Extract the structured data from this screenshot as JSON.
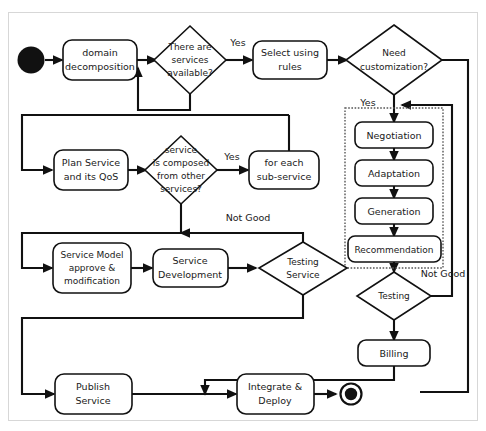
{
  "diagram": {
    "colors": {
      "stroke": "#111111",
      "background": "#ffffff",
      "group_frame": "#555555",
      "text": "#1a1a1a"
    },
    "start_node": {
      "name": "start",
      "label": ""
    },
    "end_node": {
      "name": "end",
      "label": ""
    },
    "nodes": [
      {
        "id": "domain_decomposition",
        "label": "domain\ndecomposition",
        "line1": "domain",
        "line2": "decomposition",
        "shape": "rounded-box"
      },
      {
        "id": "select_using_rules",
        "label": "Select using\nrules",
        "line1": "Select using",
        "line2": "rules",
        "shape": "rounded-box"
      },
      {
        "id": "plan_service_qos",
        "label": "Plan Service\nand its QoS",
        "line1": "Plan Service",
        "line2": "and its QoS",
        "shape": "rounded-box"
      },
      {
        "id": "for_each_sub_service",
        "label": "for each\nsub-service",
        "line1": "for each",
        "line2": "sub-service",
        "shape": "rounded-box"
      },
      {
        "id": "negotiation",
        "label": "Negotiation",
        "line1": "Negotiation",
        "line2": "",
        "shape": "rounded-box"
      },
      {
        "id": "adaptation",
        "label": "Adaptation",
        "line1": "Adaptation",
        "line2": "",
        "shape": "rounded-box"
      },
      {
        "id": "generation",
        "label": "Generation",
        "line1": "Generation",
        "line2": "",
        "shape": "rounded-box"
      },
      {
        "id": "recommendation",
        "label": "Recommendation",
        "line1": "Recommendation",
        "line2": "",
        "shape": "rounded-box"
      },
      {
        "id": "service_model_approve",
        "label": "Service Model\napprove &\nmodification",
        "line1": "Service Model",
        "line2": "approve &",
        "line3": "modification",
        "shape": "rounded-box"
      },
      {
        "id": "service_development",
        "label": "Service\nDevelopment",
        "line1": "Service",
        "line2": "Development",
        "shape": "rounded-box"
      },
      {
        "id": "billing",
        "label": "Billing",
        "line1": "Billing",
        "line2": "",
        "shape": "rounded-box"
      },
      {
        "id": "publish_service",
        "label": "Publish\nService",
        "line1": "Publish",
        "line2": "Service",
        "shape": "rounded-box"
      },
      {
        "id": "integrate_deploy",
        "label": "Integrate &\nDeploy",
        "line1": "Integrate &",
        "line2": "Deploy",
        "shape": "rounded-box"
      }
    ],
    "decisions": [
      {
        "id": "services_available",
        "label": "There are\nservices\navailable?",
        "line1": "There are",
        "line2": "services",
        "line3": "available?",
        "shape": "diamond"
      },
      {
        "id": "need_customization",
        "label": "Need\ncustomization?",
        "line1": "Need",
        "line2": "customization?",
        "line3": "",
        "shape": "diamond"
      },
      {
        "id": "service_composed",
        "label": "service\nis composed\nfrom other\nservices?",
        "line1": "service",
        "line2": "is composed",
        "line3": "from other",
        "line4": "services?",
        "shape": "diamond"
      },
      {
        "id": "testing_service",
        "label": "Testing\nService",
        "line1": "Testing",
        "line2": "Service",
        "line3": "",
        "shape": "diamond"
      },
      {
        "id": "testing",
        "label": "Testing",
        "line1": "Testing",
        "line2": "",
        "line3": "",
        "shape": "diamond"
      }
    ],
    "group": {
      "id": "customization_group",
      "label": "",
      "style": "dotted",
      "members": [
        "negotiation",
        "adaptation",
        "generation",
        "recommendation"
      ]
    },
    "edge_labels": [
      {
        "id": "yes_services",
        "text": "Yes"
      },
      {
        "id": "yes_customization",
        "text": "Yes"
      },
      {
        "id": "yes_composed",
        "text": "Yes"
      },
      {
        "id": "not_good_composed",
        "text": "Not Good"
      },
      {
        "id": "not_good_testing",
        "text": "Not Good"
      }
    ]
  }
}
